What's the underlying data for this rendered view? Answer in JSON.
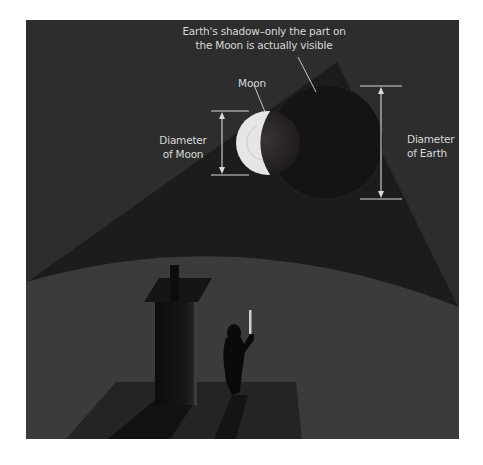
{
  "diagram": {
    "annotations": {
      "earth_shadow": "Earth's shadow–only the part on\nthe Moon is actually visible",
      "moon": "Moon",
      "diameter_of_moon": "Diameter\nof Moon",
      "diameter_of_earth": "Diameter\nof Earth"
    },
    "elements": {
      "sky": "dark night sky",
      "shadow_cone": "Earth's shadow cone",
      "earth_ground": "curved surface of Earth",
      "moon_disk": "Moon in partial eclipse",
      "earth_shadow_disk": "Earth's shadow circle",
      "tower": "tower",
      "observer": "person holding a measuring stick",
      "platform": "ground platform"
    },
    "colors": {
      "sky": "#2d2d2d",
      "cone": "#1c1c1c",
      "ground": "#3b3b3b",
      "shadow_disk": "#141414",
      "moon_lit": "#e6e6e6",
      "label": "#d8d8d8"
    }
  }
}
